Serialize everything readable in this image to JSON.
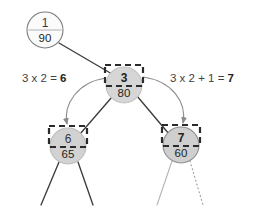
{
  "diagram": {
    "type": "binary-heap-array-index-tree",
    "background_color": "#ffffff",
    "nodes": [
      {
        "id": "node-1",
        "index_label": "1",
        "value_label": "90",
        "cx": 45,
        "cy": 30,
        "r": 18,
        "fill": "#fbfbfb",
        "stroke": "#7d7d7d",
        "highlighted": false,
        "index_bold": false
      },
      {
        "id": "node-3",
        "index_label": "3",
        "value_label": "80",
        "cx": 124,
        "cy": 85,
        "r": 18,
        "fill": "#d6d6d6",
        "stroke": "#c2c2c2",
        "highlighted": true,
        "index_bold": true
      },
      {
        "id": "node-6",
        "index_label": "6",
        "value_label": "65",
        "cx": 68,
        "cy": 146,
        "r": 18,
        "fill": "#d2d2d2",
        "stroke": "#bdbdbd",
        "highlighted": true,
        "index_bold": false
      },
      {
        "id": "node-7",
        "index_label": "7",
        "value_label": "60",
        "cx": 181,
        "cy": 145,
        "r": 18,
        "fill": "#cfcfcf",
        "stroke": "#8f8f8f",
        "highlighted": true,
        "index_bold": true
      }
    ],
    "highlight_boxes": [
      {
        "id": "box-node-3",
        "x": 105,
        "y": 65,
        "width": 38,
        "height": 21
      },
      {
        "id": "box-node-6",
        "x": 49,
        "y": 126,
        "width": 38,
        "height": 21
      },
      {
        "id": "box-node-7",
        "x": 162,
        "y": 125,
        "width": 38,
        "height": 21
      }
    ],
    "annotations": [
      {
        "id": "left-formula",
        "expression": "3 x 2 = ",
        "result": "6",
        "x": 22,
        "y": 82
      },
      {
        "id": "right-formula",
        "expression": "3 x 2 + 1 = ",
        "result": "7",
        "x": 170,
        "y": 82
      }
    ],
    "colors": {
      "edge_solid": "#3c3c3c",
      "edge_faint": "#b4b4b4",
      "arc": "#8d8d8d",
      "highlight_stroke": "#2b2b2b",
      "text": "#231f20",
      "annotation_text": "#3f3f3f"
    }
  }
}
